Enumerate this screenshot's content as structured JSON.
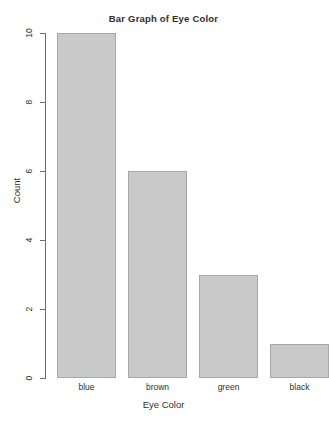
{
  "chart_data": {
    "type": "bar",
    "title": "Bar Graph of Eye Color",
    "xlabel": "Eye Color",
    "ylabel": "Count",
    "categories": [
      "blue",
      "brown",
      "green",
      "black"
    ],
    "values": [
      10,
      6,
      3,
      1
    ],
    "ylim": [
      0,
      10
    ],
    "yticks": [
      0,
      2,
      4,
      6,
      8,
      10
    ],
    "ytick_labels": [
      "0",
      "2",
      "4",
      "6",
      "8",
      "10"
    ],
    "grid": false,
    "legend": false,
    "bar_fill_color": "#c9c9c9",
    "bar_border_color": "#a8a8a8",
    "axis_color": "#6e6e6e",
    "text_color": "#2f2f2f",
    "background_color": "#ffffff"
  }
}
